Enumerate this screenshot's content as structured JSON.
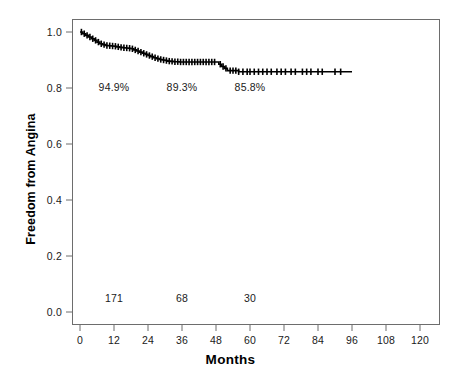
{
  "chart_data": {
    "type": "line",
    "subtype": "kaplan-meier-survival-curve",
    "title": "",
    "xlabel": "Months",
    "ylabel": "Freedom from Angina",
    "xlim": [
      0,
      120
    ],
    "ylim": [
      0.0,
      1.0
    ],
    "xticks": [
      0,
      12,
      24,
      36,
      48,
      60,
      72,
      84,
      96,
      108,
      120
    ],
    "xtick_labels": [
      "0",
      "12",
      "24",
      "36",
      "48",
      "60",
      "72",
      "84",
      "96",
      "108",
      "120"
    ],
    "yticks": [
      0.0,
      0.2,
      0.4,
      0.6,
      0.8,
      1.0
    ],
    "ytick_labels": [
      "0.0",
      "0.2",
      "0.4",
      "0.6",
      "0.8",
      "1.0"
    ],
    "grid": false,
    "legend": null,
    "line_color": "#000000",
    "frame_color": "#6d6d6d",
    "annotations": {
      "survival_percents": [
        {
          "label": "94.9%",
          "x": 12,
          "y": 0.8
        },
        {
          "label": "89.3%",
          "x": 36,
          "y": 0.8
        },
        {
          "label": "85.8%",
          "x": 60,
          "y": 0.8
        }
      ],
      "numbers_at_risk": [
        {
          "label": "171",
          "x": 12,
          "y": 0.045
        },
        {
          "label": "68",
          "x": 36,
          "y": 0.045
        },
        {
          "label": "30",
          "x": 60,
          "y": 0.045
        }
      ]
    },
    "series": [
      {
        "name": "Freedom from Angina",
        "step": "post",
        "x": [
          0,
          1,
          2,
          3,
          4,
          5,
          6,
          7,
          8,
          9,
          10,
          11,
          12,
          13,
          14,
          15,
          16,
          17,
          18,
          19,
          20,
          21,
          22,
          23,
          24,
          25,
          26,
          27,
          28,
          29,
          30,
          31,
          32,
          33,
          34,
          35,
          36,
          40,
          44,
          48,
          49,
          50,
          51,
          52,
          56,
          60,
          64,
          68,
          72,
          76,
          80,
          84,
          88,
          92,
          96
        ],
        "y": [
          1.0,
          0.994,
          0.988,
          0.982,
          0.976,
          0.97,
          0.964,
          0.958,
          0.955,
          0.952,
          0.951,
          0.95,
          0.949,
          0.947,
          0.945,
          0.944,
          0.943,
          0.942,
          0.94,
          0.936,
          0.932,
          0.928,
          0.924,
          0.92,
          0.916,
          0.912,
          0.908,
          0.905,
          0.902,
          0.9,
          0.898,
          0.896,
          0.895,
          0.894,
          0.894,
          0.893,
          0.893,
          0.893,
          0.893,
          0.893,
          0.885,
          0.877,
          0.87,
          0.862,
          0.858,
          0.858,
          0.858,
          0.858,
          0.858,
          0.858,
          0.858,
          0.858,
          0.858,
          0.858,
          0.858
        ]
      }
    ],
    "censor_marks": {
      "description": "vertical tick marks drawn along the survival curve for censored observations",
      "x": [
        0.5,
        1.5,
        2.5,
        3.5,
        4.5,
        5.5,
        6.5,
        7.5,
        8.5,
        9.5,
        10.5,
        11.5,
        12.5,
        13.5,
        14.5,
        15.5,
        16.5,
        17.5,
        18.5,
        19.5,
        20.5,
        21.5,
        22.5,
        23.5,
        24.5,
        25.5,
        26.5,
        27.5,
        28.5,
        29.5,
        30.5,
        31.5,
        32.5,
        33.5,
        34.5,
        35.5,
        36.5,
        37.5,
        38.5,
        39.5,
        40.5,
        41.5,
        42.5,
        43.5,
        44.5,
        45.5,
        46.5,
        47.5,
        49.5,
        50.5,
        51.5,
        53,
        54,
        55,
        56,
        57.5,
        59,
        60,
        61.5,
        63,
        64.5,
        66,
        67.5,
        69.5,
        71,
        72.5,
        74.5,
        76,
        78.5,
        80,
        81.5,
        84,
        85.5,
        90,
        92
      ]
    }
  }
}
